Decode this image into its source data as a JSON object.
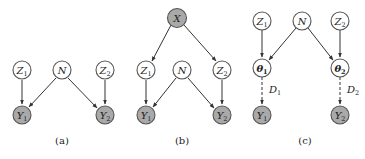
{
  "panels": [
    {
      "id": "a",
      "caption": "(a)",
      "nodes": [
        {
          "name": "Z",
          "sub": "1",
          "observed": false
        },
        {
          "name": "N",
          "sub": "",
          "observed": false
        },
        {
          "name": "Z",
          "sub": "2",
          "observed": false
        },
        {
          "name": "Y",
          "sub": "1",
          "observed": true
        },
        {
          "name": "Y",
          "sub": "2",
          "observed": true
        }
      ],
      "edges": [
        [
          "Z1",
          "Y1"
        ],
        [
          "N",
          "Y1"
        ],
        [
          "N",
          "Y2"
        ],
        [
          "Z2",
          "Y2"
        ]
      ]
    },
    {
      "id": "b",
      "caption": "(b)",
      "nodes": [
        {
          "name": "X",
          "sub": "",
          "observed": true
        },
        {
          "name": "Z",
          "sub": "1",
          "observed": false
        },
        {
          "name": "N",
          "sub": "",
          "observed": false
        },
        {
          "name": "Z",
          "sub": "2",
          "observed": false
        },
        {
          "name": "Y",
          "sub": "1",
          "observed": true
        },
        {
          "name": "Y",
          "sub": "2",
          "observed": true
        }
      ],
      "edges": [
        [
          "X",
          "Z1"
        ],
        [
          "X",
          "Z2"
        ],
        [
          "Z1",
          "Y1"
        ],
        [
          "N",
          "Y1"
        ],
        [
          "N",
          "Y2"
        ],
        [
          "Z2",
          "Y2"
        ]
      ]
    },
    {
      "id": "c",
      "caption": "(c)",
      "nodes": [
        {
          "name": "Z",
          "sub": "1",
          "observed": false
        },
        {
          "name": "N",
          "sub": "",
          "observed": false
        },
        {
          "name": "Z",
          "sub": "2",
          "observed": false
        },
        {
          "name": "θ",
          "sub": "1",
          "observed": false
        },
        {
          "name": "θ",
          "sub": "2",
          "observed": false
        },
        {
          "name": "Y",
          "sub": "1",
          "observed": true
        },
        {
          "name": "Y",
          "sub": "2",
          "observed": true
        }
      ],
      "edges": [
        [
          "Z1",
          "θ1"
        ],
        [
          "N",
          "θ1"
        ],
        [
          "N",
          "θ2"
        ],
        [
          "Z2",
          "θ2"
        ]
      ],
      "dashed_edges": [
        {
          "from": "θ1",
          "to": "Y1",
          "label": "D",
          "label_sub": "1"
        },
        {
          "from": "θ2",
          "to": "Y2",
          "label": "D",
          "label_sub": "2"
        }
      ]
    }
  ],
  "colors": {
    "observed_fill": "#a9a9a9",
    "latent_fill": "#ffffff",
    "stroke": "#555555"
  }
}
